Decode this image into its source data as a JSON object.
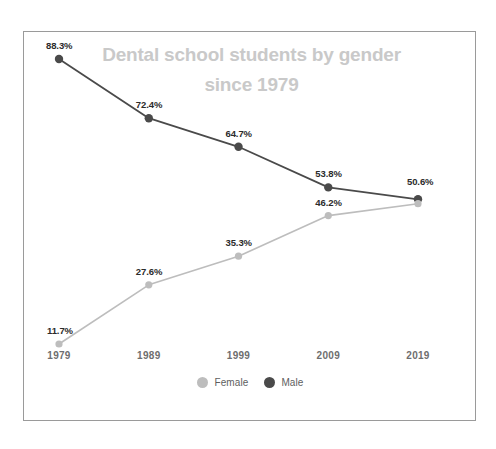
{
  "chart_data": {
    "type": "line",
    "title": "Dental school students by gender\nsince 1979",
    "title_line1": "Dental school students by gender",
    "title_line2": "since 1979",
    "xlabel": "",
    "ylabel": "",
    "categories": [
      "1979",
      "1989",
      "1999",
      "2009",
      "2019"
    ],
    "ylim": [
      0,
      100
    ],
    "grid": false,
    "legend_position": "bottom-center",
    "value_suffix": "%",
    "series": [
      {
        "name": "Female",
        "color": "#bdbdbd",
        "values": [
          11.7,
          27.6,
          35.3,
          46.2,
          49.4
        ],
        "labels": [
          "11.7%",
          "27.6%",
          "35.3%",
          "46.2%",
          "50.6%"
        ]
      },
      {
        "name": "Male",
        "color": "#4a4a4a",
        "values": [
          88.3,
          72.4,
          64.7,
          53.8,
          50.6
        ],
        "labels": [
          "88.3%",
          "72.4%",
          "64.7%",
          "53.8%",
          "50.6%"
        ]
      }
    ]
  },
  "legend": {
    "items": [
      {
        "label": "Female",
        "color": "#bdbdbd"
      },
      {
        "label": "Male",
        "color": "#4a4a4a"
      }
    ]
  },
  "axis": {
    "x_ticks": [
      "1979",
      "1989",
      "1999",
      "2009",
      "2019"
    ]
  },
  "labels": {
    "female": [
      "11.7%",
      "27.6%",
      "35.3%",
      "46.2%",
      "50.6%"
    ],
    "male": [
      "88.3%",
      "72.4%",
      "64.7%",
      "53.8%",
      "50.6%"
    ]
  },
  "colors": {
    "male": "#4a4a4a",
    "female": "#bdbdbd",
    "title": "#c9c9c9",
    "tick": "#6e6e6e",
    "border": "#9a9a9a",
    "background": "#ffffff"
  }
}
